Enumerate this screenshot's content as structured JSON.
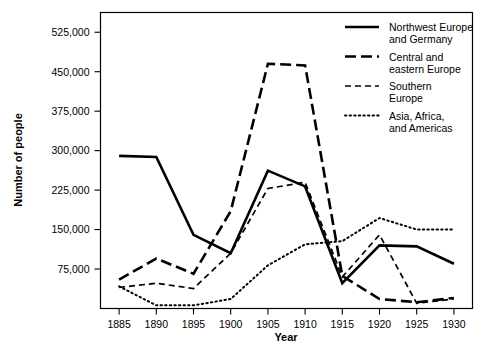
{
  "chart_data": {
    "type": "line",
    "title": "",
    "xlabel": "Year",
    "ylabel": "Number of people",
    "x": [
      1885,
      1890,
      1895,
      1900,
      1905,
      1910,
      1915,
      1920,
      1925,
      1930
    ],
    "xlim": [
      1882.5,
      1932.5
    ],
    "ylim": [
      0,
      562500
    ],
    "xticks": [
      "1885",
      "1890",
      "1895",
      "1900",
      "1905",
      "1910",
      "1915",
      "1920",
      "1925",
      "1930"
    ],
    "yticks": [
      "75,000",
      "150,000",
      "225,000",
      "300,000",
      "375,000",
      "450,000",
      "525,000"
    ],
    "ytick_values": [
      75000,
      150000,
      225000,
      300000,
      375000,
      450000,
      525000
    ],
    "grid": false,
    "legend_position": "top-right",
    "series": [
      {
        "name": "Northwest Europe and Germany",
        "style": "solid",
        "values": [
          290000,
          288000,
          140000,
          105000,
          262000,
          232000,
          48000,
          120000,
          118000,
          85000
        ]
      },
      {
        "name": "Central and eastern Europe",
        "style": "long-dash",
        "values": [
          55000,
          95000,
          66000,
          185000,
          465000,
          462000,
          62000,
          18000,
          12000,
          20000
        ]
      },
      {
        "name": "Southern Europe",
        "style": "short-dash",
        "values": [
          40000,
          48000,
          38000,
          105000,
          228000,
          240000,
          60000,
          140000,
          10000,
          18000
        ]
      },
      {
        "name": "Asia, Africa, and Americas",
        "style": "dotted",
        "values": [
          42000,
          6000,
          6000,
          18000,
          82000,
          122000,
          128000,
          172000,
          150000,
          150000
        ]
      }
    ]
  },
  "legend": {
    "entries": [
      {
        "label_line1": "Northwest Europe",
        "label_line2": "and Germany",
        "style": "solid"
      },
      {
        "label_line1": "Central and",
        "label_line2": "eastern Europe",
        "style": "long-dash"
      },
      {
        "label_line1": "Southern",
        "label_line2": "Europe",
        "style": "short-dash"
      },
      {
        "label_line1": "Asia, Africa,",
        "label_line2": "and Americas",
        "style": "dotted"
      }
    ]
  }
}
